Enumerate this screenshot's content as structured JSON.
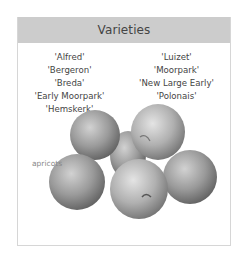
{
  "panel": {
    "title": "Varieties",
    "varieties_left": [
      "'Alfred'",
      "'Bergeron'",
      "'Breda'",
      "'Early Moorpark'",
      "'Hemskerk'"
    ],
    "varieties_right": [
      "'Luizet'",
      "'Moorpark'",
      "'New Large Early'",
      "'Polonais'"
    ],
    "image_caption": "apricots"
  },
  "colors": {
    "header_bg": "#cccccc",
    "border": "#d6d6d6",
    "text": "#444444",
    "caption": "#888888"
  }
}
